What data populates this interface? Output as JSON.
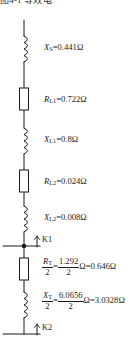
{
  "figure": {
    "type": "single-line-impedance-ladder",
    "title_fragment": "图4-1  等效电路",
    "line_color": "#1a1a1a",
    "background": "#ffffff"
  },
  "elements": [
    {
      "id": "xs",
      "symbol": "inductor",
      "label_main": "X",
      "label_sub": "S",
      "relation": "=",
      "value": "0.441",
      "unit": "Ω"
    },
    {
      "id": "rl1",
      "symbol": "resistor",
      "label_main": "R",
      "label_sub": "L1",
      "relation": "=",
      "value": "0.722",
      "unit": "Ω"
    },
    {
      "id": "xl1",
      "symbol": "inductor",
      "label_main": "X",
      "label_sub": "L1",
      "relation": "=",
      "value": "0.8",
      "unit": "Ω"
    },
    {
      "id": "rl2",
      "symbol": "resistor",
      "label_main": "R",
      "label_sub": "L2",
      "relation": "=",
      "value": "0.024",
      "unit": "Ω"
    },
    {
      "id": "xl2",
      "symbol": "inductor",
      "label_main": "X",
      "label_sub": "L2",
      "relation": "=",
      "value": "0.008",
      "unit": "Ω"
    },
    {
      "id": "rt2",
      "symbol": "resistor",
      "label_main": "R",
      "label_sub": "T",
      "fraction_left_den": "2",
      "relation": "=",
      "fraction_right_num": "1.292",
      "fraction_right_den": "2",
      "unit": "Ω",
      "result_relation": "=",
      "result_value": "0.646",
      "result_unit": "Ω"
    },
    {
      "id": "xt2",
      "symbol": "inductor",
      "label_main": "X",
      "label_sub": "T",
      "fraction_left_den": "2",
      "relation": "=",
      "fraction_right_num": "6.0656",
      "fraction_right_den": "2",
      "unit": "Ω",
      "result_relation": "=",
      "result_value": "3.0328",
      "result_unit": "Ω"
    }
  ],
  "nodes": [
    {
      "id": "k1",
      "label": "K1",
      "marker": "fault-arrow"
    },
    {
      "id": "k2",
      "label": "K2",
      "marker": "fault-arrow"
    }
  ]
}
